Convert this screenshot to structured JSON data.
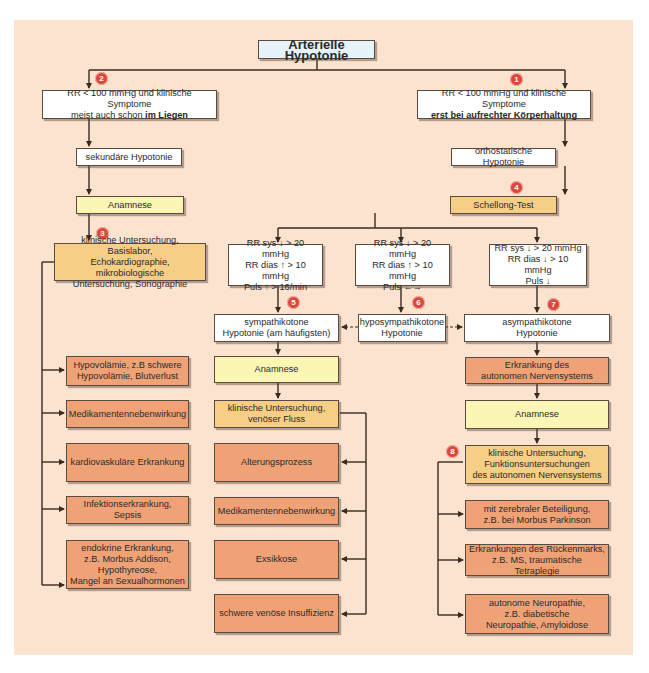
{
  "diagram": {
    "title": "Arterielle Hypotonie",
    "colors": {
      "background": "#fbe3cf",
      "white_box": "#ffffff",
      "yellow_box": "#fbf6b3",
      "amber_box": "#f6ce85",
      "salmon_box": "#f0a277",
      "title_box": "#e6f3fb",
      "badge": "#d9483b",
      "line": "#3a2a22"
    },
    "left_branch": {
      "badge": "2",
      "criteria_line1": "RR < 100 mmHg und klinische Symptome",
      "criteria_line2_prefix": "meist auch schon ",
      "criteria_line2_bold": "im Liegen",
      "type": "sekundäre Hypotonie",
      "anamnese": "Anamnese",
      "exam_badge": "3",
      "exam": "klinische Untersuchung, Basislabor,\nEchokardiographie, mikrobiologische\nUntersuchung, Sonographie",
      "causes": [
        "Hypovolämie, z.B schwere\nHypovolämie, Blutverlust",
        "Medikamentennebenwirkung",
        "kardiovaskuläre Erkrankung",
        "Infektionserkrankung, Sepsis",
        "endokrine Erkrankung,\nz.B. Morbus Addison,\nHypothyreose,\nMangel an Sexualhormonen"
      ]
    },
    "right_branch": {
      "badge": "1",
      "criteria_line1": "RR < 100 mmHg und klinische Symptome",
      "criteria_line2_bold": "erst bei aufrechter Körperhaltung",
      "type": "orthostatische Hypotonie",
      "test_badge": "4",
      "test": "Schellong-Test",
      "results": [
        {
          "text": "RR sys ↓ > 20 mmHg\nRR dias ↑ > 10 mmHg\nPuls ↑ > 16/min",
          "badge": "5",
          "type": "sympathikotone\nHypotonie (am häufigsten)"
        },
        {
          "text": "RR sys ↓ > 20 mmHg\nRR dias ↑ > 10 mmHg\nPuls ←→",
          "badge": "6",
          "type": "hyposympathikotone\nHypotonie"
        },
        {
          "text": "RR sys ↓ > 20 mmHg\nRR dias ↓ > 10 mmHg\nPuls ↓",
          "badge": "7",
          "type": "asympathikotone\nHypotonie"
        }
      ],
      "sympathikoton": {
        "anamnese": "Anamnese",
        "exam": "klinische Untersuchung,\nvenöser Fluss",
        "causes": [
          "Alterungsprozess",
          "Medikamentennebenwirkung",
          "Exsikkose",
          "schwere venöse Insuffizienz"
        ]
      },
      "asympathikoton": {
        "disease": "Erkrankung des\nautonomen Nervensystems",
        "anamnese": "Anamnese",
        "exam_badge": "8",
        "exam": "klinische Untersuchung,\nFunktionsuntersuchungen\ndes autonomen Nervensystems",
        "causes": [
          "mit zerebraler Beteiligung,\nz.B. bei Morbus Parkinson",
          "Erkrankungen des Rückenmarks,\nz.B. MS, traumatische Tetraplegie",
          "autonome Neuropathie,\nz.B. diabetische\nNeuropathie, Amyloidose"
        ]
      }
    }
  }
}
